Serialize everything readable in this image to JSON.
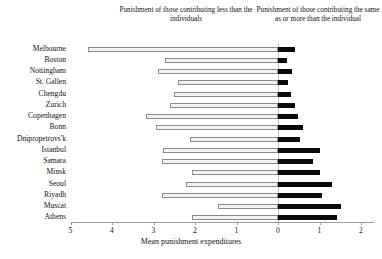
{
  "annotations": {
    "left": "Punishment of those contributing less than the individuals",
    "right": "Punishment of those contributing the same as or more than the individual"
  },
  "axis": {
    "xlabel": "Mean punishment expenditures",
    "xticks": [
      "5",
      "4",
      "3",
      "2",
      "1",
      "0",
      "1",
      "2"
    ]
  },
  "colors": {
    "negative_bar_fill": "#f2f2f2",
    "negative_bar_stroke": "#8c8c8c",
    "positive_bar_fill": "#0a0a0a",
    "axis": "#9a9a9a"
  },
  "chart_data": {
    "type": "bar",
    "title": "",
    "xlabel": "Mean punishment expenditures",
    "ylabel": "",
    "orientation": "horizontal",
    "note": "Diverging bar chart. Left (light/outlined) bars = punishment of those contributing less than the individual, plotted as magnitude on a reversed axis from 5 to 0. Right (black) bars = punishment of those contributing the same as or more than the individual, 0 to 2.",
    "xlim": [
      5,
      2
    ],
    "xtick_values": [
      5,
      4,
      3,
      2,
      1,
      0,
      1,
      2
    ],
    "grid": false,
    "legend": "none",
    "categories": [
      "Melbourne",
      "Boston",
      "Nottingham",
      "St. Gallen",
      "Chengdu",
      "Zurich",
      "Copenhagen",
      "Bonn",
      "Dnipropetrovs'k",
      "Istanbul",
      "Samara",
      "Minsk",
      "Seoul",
      "Riyadh",
      "Muscat",
      "Athens"
    ],
    "series": [
      {
        "name": "Punishment of those contributing less than the individuals",
        "side": "left",
        "values": [
          4.58,
          2.72,
          2.89,
          2.41,
          2.51,
          2.6,
          3.18,
          2.94,
          2.12,
          2.77,
          2.8,
          2.07,
          2.22,
          2.8,
          1.45,
          2.07
        ]
      },
      {
        "name": "Punishment of those contributing the same as or more than the individual",
        "side": "right",
        "values": [
          0.41,
          0.22,
          0.34,
          0.24,
          0.31,
          0.41,
          0.48,
          0.6,
          0.53,
          1.01,
          0.84,
          1.01,
          1.3,
          1.06,
          1.52,
          1.42
        ]
      }
    ]
  }
}
